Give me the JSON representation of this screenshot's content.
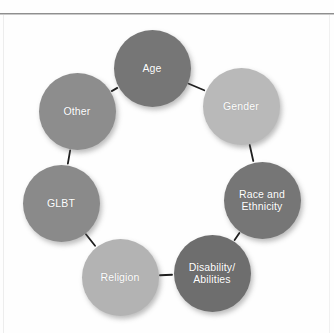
{
  "diagram": {
    "type": "cycle",
    "node_count": 8,
    "node_diameter": 77,
    "connector_color": "#1f1f1f",
    "background": "#fefefe",
    "nodes": [
      {
        "id": "age",
        "label": "Age",
        "lines": [
          "Age"
        ],
        "color": "#767676",
        "cx": 152,
        "cy": 53,
        "r": 38.5
      },
      {
        "id": "gender",
        "label": "Gender",
        "lines": [
          "Gender"
        ],
        "color": "#b9b9b9",
        "cx": 241,
        "cy": 91,
        "r": 38.5
      },
      {
        "id": "race",
        "label": "Race and Ethnicity",
        "lines": [
          "Race and",
          "Ethnicity"
        ],
        "color": "#767676",
        "cx": 262,
        "cy": 185,
        "r": 38.5
      },
      {
        "id": "disability",
        "label": "Disability/Abilities",
        "lines": [
          "Disability/",
          "Abilities"
        ],
        "color": "#6e6e6e",
        "cx": 212,
        "cy": 258,
        "r": 38.5
      },
      {
        "id": "religion",
        "label": "Religion",
        "lines": [
          "Religion"
        ],
        "color": "#b3b3b3",
        "cx": 120,
        "cy": 262,
        "r": 38.5
      },
      {
        "id": "glbt",
        "label": "GLBT",
        "lines": [
          "GLBT"
        ],
        "color": "#8a8a8a",
        "cx": 61,
        "cy": 188,
        "r": 38.5
      },
      {
        "id": "other",
        "label": "Other",
        "lines": [
          "Other"
        ],
        "color": "#8d8d8d",
        "cx": 77,
        "cy": 96,
        "r": 38.5
      }
    ],
    "connectors": [
      {
        "from": "other",
        "to": "age"
      },
      {
        "from": "age",
        "to": "gender"
      },
      {
        "from": "gender",
        "to": "race"
      },
      {
        "from": "race",
        "to": "disability"
      },
      {
        "from": "disability",
        "to": "religion"
      },
      {
        "from": "religion",
        "to": "glbt"
      },
      {
        "from": "glbt",
        "to": "other"
      }
    ]
  }
}
